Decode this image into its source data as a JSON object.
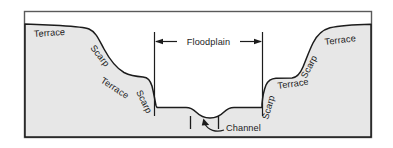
{
  "figure": {
    "kind": "geological-cross-section",
    "frame": {
      "border_color": "#555555",
      "background_color": "#ffffff"
    },
    "terrain": {
      "fill_color": "#e7e7e7",
      "outline_color": "#1c1c1c",
      "floodplain_floor_label": "floodplain floor",
      "channel_present": true
    }
  },
  "labels": {
    "left": [
      {
        "id": "left-terrace-upper",
        "text": "Terrace",
        "rotation": -4
      },
      {
        "id": "left-scarp-upper",
        "text": "Scarp",
        "rotation": 52
      },
      {
        "id": "left-terrace-lower",
        "text": "Terrace",
        "rotation": 33
      },
      {
        "id": "left-scarp-lower",
        "text": "Scarp",
        "rotation": 64
      }
    ],
    "right": [
      {
        "id": "right-scarp-lower",
        "text": "Scarp",
        "rotation": -74
      },
      {
        "id": "right-terrace-lower",
        "text": "Terrace",
        "rotation": -8
      },
      {
        "id": "right-scarp-upper",
        "text": "Scarp",
        "rotation": -62
      },
      {
        "id": "right-terrace-upper",
        "text": "Terrace",
        "rotation": -7
      }
    ],
    "center": {
      "floodplain": "Floodplain",
      "channel": "Channel"
    }
  },
  "annotations": {
    "floodplain_extent": {
      "label": "Floodplain",
      "arrow_style": "double-headed",
      "left_boundary_x": 154,
      "right_boundary_x": 262,
      "boundary_line_top_y": 32,
      "boundary_line_bottom_y": 116
    },
    "channel_callout": {
      "label": "Channel",
      "arrow_style": "curved-leader-up",
      "tick_left_x": 190,
      "tick_right_x": 218,
      "tick_top_y": 116,
      "tick_bottom_y": 130
    }
  }
}
